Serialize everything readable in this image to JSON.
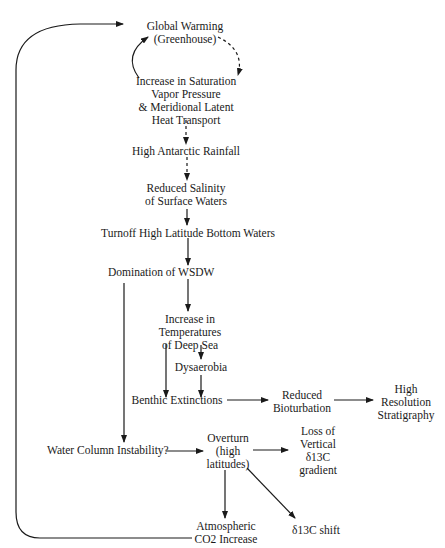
{
  "diagram": {
    "type": "flowchart",
    "nodes": {
      "global_warming": {
        "lines": [
          "Global Warming",
          "(Greenhouse)"
        ]
      },
      "saturation": {
        "lines": [
          "Increase in Saturation",
          "Vapor Pressure",
          "& Meridional Latent",
          "Heat Transport"
        ]
      },
      "rainfall": {
        "lines": [
          "High Antarctic Rainfall"
        ]
      },
      "salinity": {
        "lines": [
          "Reduced Salinity",
          "of Surface Waters"
        ]
      },
      "turnoff": {
        "lines": [
          "Turnoff High Latitude Bottom Waters"
        ]
      },
      "wsdw": {
        "lines": [
          "Domination of WSDW"
        ]
      },
      "deep_sea_temp": {
        "lines": [
          "Increase in",
          "Temperatures",
          "of Deep Sea"
        ]
      },
      "dysaerobia": {
        "lines": [
          "Dysaerobia"
        ]
      },
      "benthic": {
        "lines": [
          "Benthic Extinctions"
        ]
      },
      "bioturbation": {
        "lines": [
          "Reduced",
          "Bioturbation"
        ]
      },
      "stratigraphy": {
        "lines": [
          "High",
          "Resolution",
          "Stratigraphy"
        ]
      },
      "instability": {
        "lines": [
          "Water Column Instability?"
        ]
      },
      "overturn": {
        "lines": [
          "Overturn",
          "(high",
          "latitudes)"
        ]
      },
      "loss_gradient": {
        "lines": [
          "Loss of",
          "Vertical",
          "δ13C",
          "gradient"
        ]
      },
      "co2": {
        "lines": [
          "Atmospheric",
          "CO2 Increase"
        ]
      },
      "d13c_shift": {
        "lines": [
          "δ13C shift"
        ]
      }
    },
    "edges": [
      {
        "from": "global_warming",
        "to": "saturation",
        "style": "dashed"
      },
      {
        "from": "saturation",
        "to": "global_warming",
        "style": "solid"
      },
      {
        "from": "saturation",
        "to": "rainfall",
        "style": "dashed"
      },
      {
        "from": "rainfall",
        "to": "salinity",
        "style": "dashed"
      },
      {
        "from": "salinity",
        "to": "turnoff",
        "style": "solid"
      },
      {
        "from": "turnoff",
        "to": "wsdw",
        "style": "solid"
      },
      {
        "from": "wsdw",
        "to": "deep_sea_temp",
        "style": "solid"
      },
      {
        "from": "wsdw",
        "to": "instability",
        "style": "solid"
      },
      {
        "from": "deep_sea_temp",
        "to": "dysaerobia",
        "style": "solid"
      },
      {
        "from": "deep_sea_temp",
        "to": "benthic",
        "style": "solid"
      },
      {
        "from": "dysaerobia",
        "to": "benthic",
        "style": "solid"
      },
      {
        "from": "benthic",
        "to": "bioturbation",
        "style": "solid"
      },
      {
        "from": "bioturbation",
        "to": "stratigraphy",
        "style": "solid"
      },
      {
        "from": "instability",
        "to": "overturn",
        "style": "solid"
      },
      {
        "from": "overturn",
        "to": "loss_gradient",
        "style": "solid"
      },
      {
        "from": "overturn",
        "to": "co2",
        "style": "solid"
      },
      {
        "from": "overturn",
        "to": "d13c_shift",
        "style": "solid"
      },
      {
        "from": "co2",
        "to": "global_warming",
        "style": "solid"
      }
    ]
  }
}
